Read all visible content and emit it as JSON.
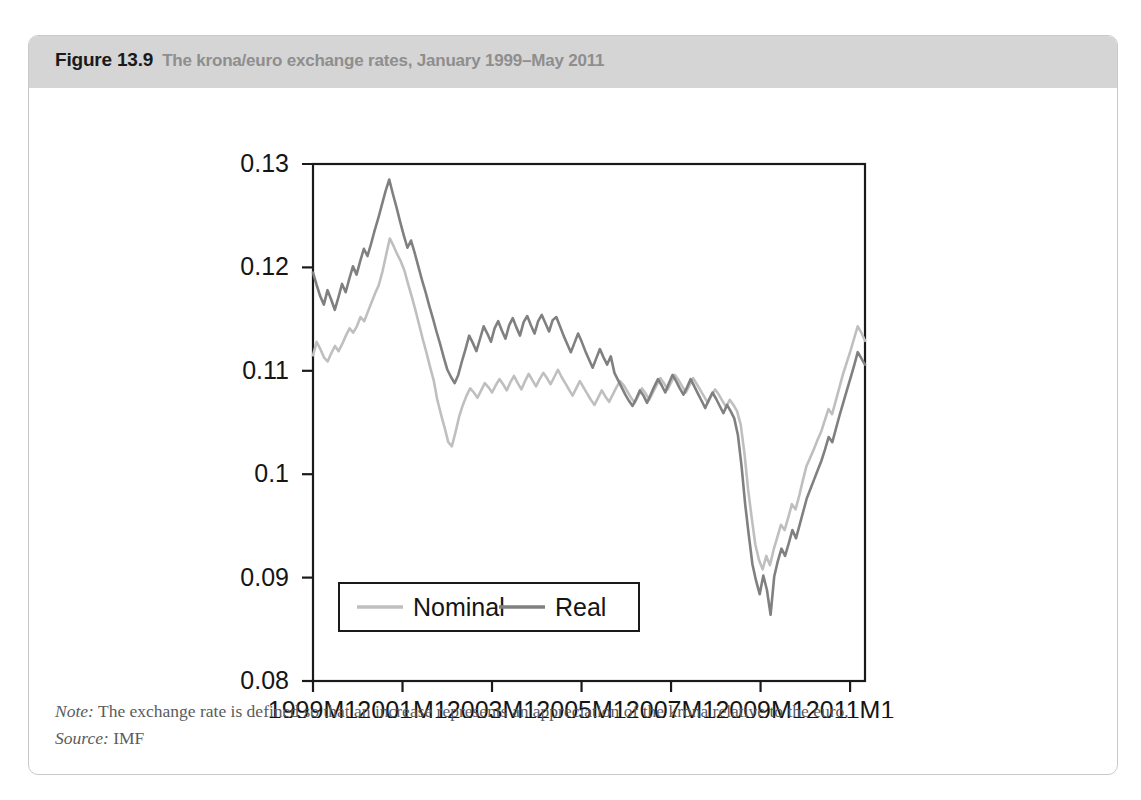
{
  "figure": {
    "number": "Figure 13.9",
    "caption": "The krona/euro exchange rates, January 1999–May 2011",
    "note_key": "Note:",
    "note_text": " The exchange rate is defined so that an increase represents an appreciation of the krona relative to the euro.",
    "source_key": "Source:",
    "source_text": " IMF"
  },
  "colors": {
    "header_band": "#d5d5d5",
    "figure_border": "#c9c9c9",
    "nominal_line": "#bfbfbf",
    "real_line": "#808080",
    "axis": "#1a1a1a",
    "title_number": "#1a1a1a",
    "title_caption": "#8e8e8e",
    "footer_text": "#5b5b5d"
  },
  "chart_data": {
    "type": "line",
    "title": "The krona/euro exchange rates, January 1999–May 2011",
    "xlabel": "",
    "ylabel": "",
    "grid": false,
    "legend_position": "bottom-left-inside",
    "ylim": [
      0.08,
      0.13
    ],
    "yticks": [
      "0.08",
      "0.09",
      "0.1",
      "0.11",
      "0.12",
      "0.13"
    ],
    "ytick_values": [
      0.08,
      0.09,
      0.1,
      0.11,
      0.12,
      0.13
    ],
    "xticks": [
      "1999M1",
      "2001M1",
      "2003M1",
      "2005M1",
      "2007M1",
      "2009M1",
      "2011M1"
    ],
    "xtick_values": [
      0,
      24,
      48,
      72,
      96,
      120,
      144
    ],
    "xlim": [
      0,
      148
    ],
    "x_start_label": "1999M1",
    "x_end_label": "2011M5",
    "n_points": 149,
    "series": [
      {
        "name": "Nominal",
        "color": "#bfbfbf",
        "values": [
          0.1115,
          0.1128,
          0.1121,
          0.1113,
          0.1109,
          0.1117,
          0.1124,
          0.1119,
          0.1126,
          0.1134,
          0.1141,
          0.1137,
          0.1143,
          0.1152,
          0.1148,
          0.1157,
          0.1166,
          0.1175,
          0.1183,
          0.1196,
          0.1212,
          0.1228,
          0.1221,
          0.1213,
          0.1206,
          0.1197,
          0.1184,
          0.1172,
          0.1159,
          0.1145,
          0.1131,
          0.1118,
          0.1104,
          0.1091,
          0.1072,
          0.1058,
          0.1045,
          0.1031,
          0.1027,
          0.1041,
          0.1056,
          0.1067,
          0.1076,
          0.1083,
          0.1079,
          0.1074,
          0.1081,
          0.1088,
          0.1084,
          0.1079,
          0.1086,
          0.1092,
          0.1087,
          0.1081,
          0.1089,
          0.1095,
          0.1088,
          0.1082,
          0.109,
          0.1097,
          0.1091,
          0.1085,
          0.1092,
          0.1098,
          0.1093,
          0.1087,
          0.1094,
          0.1101,
          0.1094,
          0.1088,
          0.1082,
          0.1076,
          0.1083,
          0.109,
          0.1084,
          0.1078,
          0.1072,
          0.1067,
          0.1074,
          0.1081,
          0.1075,
          0.107,
          0.1077,
          0.1084,
          0.109,
          0.1086,
          0.108,
          0.1074,
          0.1069,
          0.1076,
          0.1083,
          0.1078,
          0.1072,
          0.1079,
          0.1086,
          0.1093,
          0.1088,
          0.1082,
          0.1089,
          0.1096,
          0.1091,
          0.1085,
          0.1079,
          0.1086,
          0.1093,
          0.1087,
          0.1081,
          0.1075,
          0.1069,
          0.1076,
          0.1082,
          0.1077,
          0.1071,
          0.1065,
          0.1072,
          0.1067,
          0.1061,
          0.1048,
          0.1021,
          0.0986,
          0.0958,
          0.0932,
          0.0917,
          0.0908,
          0.0921,
          0.0912,
          0.0927,
          0.0939,
          0.0951,
          0.0946,
          0.0958,
          0.0971,
          0.0966,
          0.0979,
          0.0994,
          0.1008,
          0.1016,
          0.1024,
          0.1033,
          0.1041,
          0.1052,
          0.1063,
          0.1058,
          0.1071,
          0.1084,
          0.1097,
          0.1108,
          0.1119,
          0.1131,
          0.1143,
          0.1137,
          0.1129
        ]
      },
      {
        "name": "Real",
        "color": "#808080",
        "values": [
          0.1195,
          0.1183,
          0.1172,
          0.1164,
          0.1178,
          0.1169,
          0.1159,
          0.1171,
          0.1184,
          0.1176,
          0.1189,
          0.1201,
          0.1193,
          0.1206,
          0.1218,
          0.1211,
          0.1223,
          0.1236,
          0.1248,
          0.1261,
          0.1274,
          0.1285,
          0.1271,
          0.1258,
          0.1244,
          0.1231,
          0.1219,
          0.1226,
          0.1214,
          0.1201,
          0.1188,
          0.1176,
          0.1163,
          0.1151,
          0.1138,
          0.1126,
          0.1113,
          0.1101,
          0.1094,
          0.1088,
          0.1096,
          0.1109,
          0.1121,
          0.1134,
          0.1127,
          0.1119,
          0.1131,
          0.1143,
          0.1136,
          0.1128,
          0.1141,
          0.1148,
          0.1139,
          0.1131,
          0.1144,
          0.1151,
          0.1142,
          0.1134,
          0.1147,
          0.1153,
          0.1144,
          0.1136,
          0.1148,
          0.1154,
          0.1146,
          0.1138,
          0.1149,
          0.1152,
          0.1143,
          0.1134,
          0.1126,
          0.1118,
          0.1127,
          0.1136,
          0.1128,
          0.1119,
          0.1111,
          0.1103,
          0.1112,
          0.1121,
          0.1113,
          0.1106,
          0.1114,
          0.1098,
          0.1091,
          0.1084,
          0.1077,
          0.1071,
          0.1066,
          0.1073,
          0.1081,
          0.1076,
          0.1069,
          0.1077,
          0.1085,
          0.1092,
          0.1086,
          0.1079,
          0.1088,
          0.1096,
          0.109,
          0.1083,
          0.1077,
          0.1084,
          0.1092,
          0.1085,
          0.1078,
          0.1071,
          0.1064,
          0.1072,
          0.1079,
          0.1073,
          0.1066,
          0.1059,
          0.1067,
          0.1061,
          0.1054,
          0.1038,
          0.1008,
          0.0971,
          0.0941,
          0.0913,
          0.0897,
          0.0884,
          0.0902,
          0.0888,
          0.0864,
          0.0901,
          0.0916,
          0.0928,
          0.0921,
          0.0933,
          0.0946,
          0.0938,
          0.0951,
          0.0964,
          0.0977,
          0.0986,
          0.0995,
          0.1004,
          0.1013,
          0.1024,
          0.1036,
          0.1031,
          0.1044,
          0.1057,
          0.1069,
          0.1081,
          0.1093,
          0.1105,
          0.1118,
          0.1112,
          0.1106
        ]
      }
    ]
  }
}
